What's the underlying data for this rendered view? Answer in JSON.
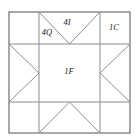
{
  "figure": {
    "name": "sawtooth-star-quilt-block",
    "background_color": "#ffffff",
    "outer_border_color": "#6e6e6e",
    "grid_line_color": "#8a8a8a",
    "diagonal_line_color": "#8f8f8f",
    "label_color": "#1a1a1a",
    "outer_border_width": 1.2,
    "grid_line_width": 1.0,
    "diagonal_line_width": 1.0,
    "geometry": {
      "left": 9,
      "top": 12,
      "right": 130,
      "bottom": 133,
      "grid_x1": 39,
      "grid_x2": 100,
      "grid_y1": 44,
      "grid_y2": 102
    },
    "labels": [
      {
        "id": "label-4i",
        "text": "4I",
        "x": 67,
        "y": 23,
        "piece": "inner-star-point-triangle",
        "count": "4",
        "code": "I"
      },
      {
        "id": "label-4q",
        "text": "4Q",
        "x": 47,
        "y": 33,
        "piece": "outer-star-point-triangle",
        "count": "4",
        "code": "Q"
      },
      {
        "id": "label-1c",
        "text": "1C",
        "x": 114,
        "y": 28,
        "piece": "corner-square",
        "count": "1",
        "code": "C"
      },
      {
        "id": "label-1f",
        "text": "1F",
        "x": 69,
        "y": 72,
        "piece": "center-square",
        "count": "1",
        "code": "F"
      }
    ],
    "grid_lines": {
      "vertical": [
        {
          "id": "grid-line-vertical-left",
          "x": 39,
          "y1": 12,
          "y2": 133
        },
        {
          "id": "grid-line-vertical-right",
          "x": 100,
          "y1": 12,
          "y2": 133
        }
      ],
      "horizontal": [
        {
          "id": "grid-line-horizontal-top",
          "y": 44,
          "x1": 9,
          "x2": 130
        },
        {
          "id": "grid-line-horizontal-bottom",
          "y": 102,
          "x1": 9,
          "x2": 130
        }
      ]
    },
    "diagonals": [
      {
        "id": "diagonal-top-left-point",
        "x1": 39,
        "y1": 12,
        "x2": 69.5,
        "y2": 44
      },
      {
        "id": "diagonal-top-right-point",
        "x1": 100,
        "y1": 12,
        "x2": 69.5,
        "y2": 44
      },
      {
        "id": "diagonal-bottom-left-point",
        "x1": 39,
        "y1": 133,
        "x2": 69.5,
        "y2": 102
      },
      {
        "id": "diagonal-bottom-right-point",
        "x1": 100,
        "y1": 133,
        "x2": 69.5,
        "y2": 102
      },
      {
        "id": "diagonal-left-top-point",
        "x1": 9,
        "y1": 44,
        "x2": 39,
        "y2": 73
      },
      {
        "id": "diagonal-left-bottom-point",
        "x1": 9,
        "y1": 102,
        "x2": 39,
        "y2": 73
      },
      {
        "id": "diagonal-right-top-point",
        "x1": 130,
        "y1": 44,
        "x2": 100,
        "y2": 73
      },
      {
        "id": "diagonal-right-bottom-point",
        "x1": 130,
        "y1": 102,
        "x2": 100,
        "y2": 73
      }
    ]
  }
}
